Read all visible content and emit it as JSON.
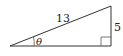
{
  "diagram": {
    "type": "right-triangle",
    "hypotenuse_label": "13",
    "opposite_label": "5",
    "angle_label": "θ",
    "right_angle_marker": true,
    "line_color": "#333333"
  }
}
